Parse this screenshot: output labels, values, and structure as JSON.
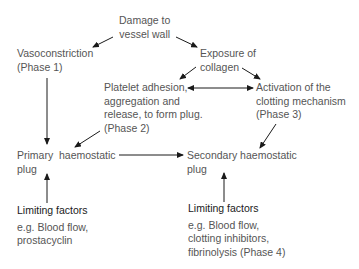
{
  "diagram": {
    "type": "flowchart",
    "topic": "Haemostasis",
    "nodes": {
      "damage": {
        "lines": [
          "Damage to",
          "vessel wall"
        ]
      },
      "vasoconstriction": {
        "lines": [
          "Vasoconstriction",
          "(Phase  1)"
        ]
      },
      "exposure": {
        "lines": [
          "Exposure of",
          "collagen"
        ]
      },
      "platelet": {
        "lines": [
          "Platelet adhesion,",
          "aggregation and",
          "release, to form plug.",
          "(Phase 2)"
        ]
      },
      "activation": {
        "lines": [
          "Activation of the",
          "clotting mechanism",
          "(Phase 3)"
        ]
      },
      "primary": {
        "lines": [
          "Primary  haemostatic",
          "plug"
        ]
      },
      "secondary": {
        "lines": [
          "Secondary haemostatic",
          "plug"
        ]
      },
      "limit_left": {
        "title": "Limiting factors",
        "lines": [
          "e.g. Blood flow,",
          "prostacyclin"
        ]
      },
      "limit_right": {
        "title": "Limiting factors",
        "lines": [
          "e.g. Blood flow,",
          "clotting inhibitors,",
          "fibrinolysis (Phase 4)"
        ]
      }
    },
    "edges": [
      {
        "from": "damage",
        "to": "vasoconstriction"
      },
      {
        "from": "damage",
        "to": "exposure"
      },
      {
        "from": "exposure",
        "to": "platelet"
      },
      {
        "from": "exposure",
        "to": "activation"
      },
      {
        "from": "platelet",
        "to": "activation",
        "bidirectional": true
      },
      {
        "from": "vasoconstriction",
        "to": "primary"
      },
      {
        "from": "platelet",
        "to": "primary"
      },
      {
        "from": "activation",
        "to": "secondary"
      },
      {
        "from": "primary",
        "to": "secondary"
      },
      {
        "from": "limit_left",
        "to": "primary"
      },
      {
        "from": "limit_right",
        "to": "secondary"
      }
    ]
  }
}
